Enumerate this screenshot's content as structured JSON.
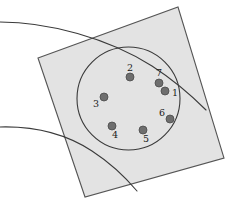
{
  "figure": {
    "background_color": "#ffffff",
    "square": {
      "name": "rotated-square",
      "fill_color": "#e3e3e3",
      "stroke_color": "#555555",
      "stroke_width": 1.1,
      "points": "38,58 178,7 224,158 85,197"
    },
    "circle": {
      "name": "inscribed-circle",
      "cx": 128.5,
      "cy": 98.5,
      "r": 51.5,
      "fill_color": "none",
      "stroke_color": "#3a3a3a",
      "stroke_width": 1.1
    },
    "curves": [
      {
        "name": "upper-curve",
        "path": "M 0,22 C 48,22 108,38 152,66 C 172,79 192,96 206,110",
        "stroke_color": "#3a3a3a",
        "stroke_width": 1.1
      },
      {
        "name": "lower-curve",
        "path": "M 0,127 C 36,126 66,134 92,151 C 112,164 126,178 137,191",
        "stroke_color": "#3a3a3a",
        "stroke_width": 1.1
      }
    ],
    "points": [
      {
        "label": "2",
        "cx": 130,
        "cy": 77,
        "lx": 130,
        "ly": 68
      },
      {
        "label": "7",
        "cx": 159,
        "cy": 83,
        "lx": 159,
        "ly": 73
      },
      {
        "label": "1",
        "cx": 165,
        "cy": 91,
        "lx": 175,
        "ly": 93
      },
      {
        "label": "3",
        "cx": 104,
        "cy": 97,
        "lx": 96,
        "ly": 104
      },
      {
        "label": "6",
        "cx": 170,
        "cy": 119,
        "lx": 162,
        "ly": 113
      },
      {
        "label": "4",
        "cx": 112,
        "cy": 126,
        "lx": 115,
        "ly": 135
      },
      {
        "label": "5",
        "cx": 143,
        "cy": 130,
        "lx": 146,
        "ly": 139
      }
    ],
    "point_style": {
      "radius": 4,
      "fill_color": "#6e6e6e",
      "stroke_color": "#4a4a4a",
      "stroke_width": 0.8,
      "label_color": "#1a1a1a",
      "label_font_size": 9.5
    }
  }
}
